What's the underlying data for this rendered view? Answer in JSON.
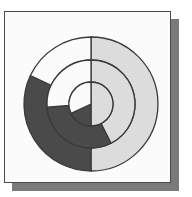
{
  "chart_data": {
    "type": "multi-level-doughnut",
    "title": "",
    "center": [
      91,
      104
    ],
    "ring_radii": [
      22,
      44,
      67
    ],
    "start_angle_deg": 0,
    "direction": "clockwise",
    "colors": {
      "light": "#dcdcdc",
      "dark": "#4a4a4a",
      "white": "#fbfbfb",
      "stroke": "#3a3a3a"
    },
    "categories": [
      "light",
      "dark",
      "white"
    ],
    "series": [
      {
        "name": "inner",
        "values": [
          50.0,
          18.0,
          32.0
        ]
      },
      {
        "name": "middle",
        "values": [
          42.5,
          31.4,
          26.1
        ]
      },
      {
        "name": "outer",
        "values": [
          50.0,
          32.0,
          18.0
        ]
      }
    ],
    "legend": "none",
    "grid": false
  },
  "frame": {
    "background": "#fbfbfb",
    "border": "#4a4a4a",
    "shadow": "#7a7a7a"
  }
}
